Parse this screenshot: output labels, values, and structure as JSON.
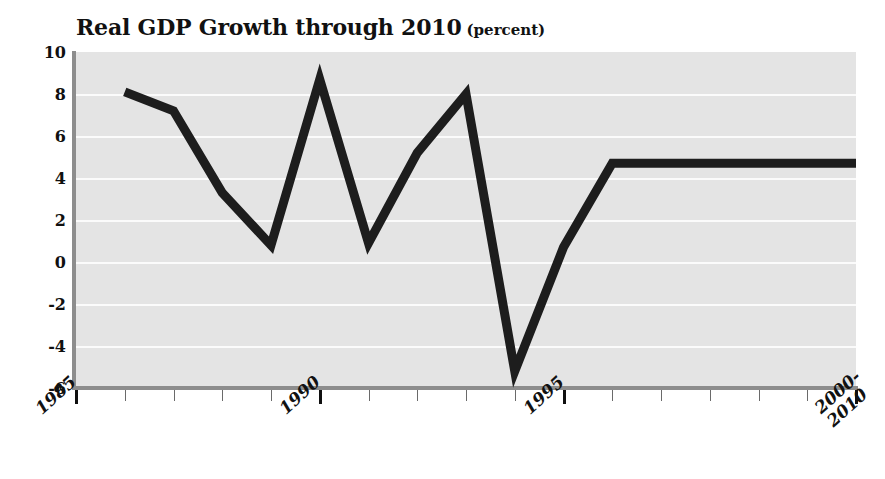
{
  "chart_data": {
    "type": "line",
    "title": "Real GDP Growth through 2010",
    "title_suffix": "(percent)",
    "xlabel": "",
    "ylabel": "",
    "grid": true,
    "legend": "none",
    "ylim": [
      -6,
      10
    ],
    "yticks": [
      10,
      8,
      6,
      4,
      2,
      0,
      -2,
      -4,
      -6
    ],
    "ytick_labels": [
      "10",
      "8",
      "6",
      "4",
      "2",
      "0",
      "-2",
      "-4",
      "-6"
    ],
    "xlim": [
      1985,
      2001
    ],
    "xtick_labels": [
      "1985",
      "1990",
      "1995",
      "2000-\n2010"
    ],
    "xtick_major_years": [
      1985,
      1990,
      1995,
      2001
    ],
    "xtick_minor_years": [
      1986,
      1987,
      1988,
      1989,
      1991,
      1992,
      1993,
      1994,
      1996,
      1997,
      1998,
      1999,
      2000
    ],
    "x": [
      1986,
      1987,
      1988,
      1989,
      1990,
      1991,
      1992,
      1993,
      1994,
      1995,
      1996,
      1997,
      1998,
      1999,
      2000,
      2001
    ],
    "values": [
      8.1,
      7.2,
      3.3,
      0.8,
      8.7,
      0.9,
      5.2,
      8.0,
      -5.2,
      0.7,
      4.7,
      4.7,
      4.7,
      4.7,
      4.7,
      4.7
    ],
    "series": [
      {
        "name": "Real GDP Growth",
        "color": "#1d1d1d",
        "line_width": 9,
        "values": [
          8.1,
          7.2,
          3.3,
          0.8,
          8.7,
          0.9,
          5.2,
          8.0,
          -5.2,
          0.7,
          4.7,
          4.7,
          4.7,
          4.7,
          4.7,
          4.7
        ]
      }
    ],
    "colors": {
      "plot_background": "#e4e4e4",
      "gridline": "#fbfbfb",
      "axis_rule": "#8d8d8d",
      "line": "#1d1d1d",
      "text": "#111111",
      "page_background": "#ffffff"
    }
  },
  "xlabels": [
    {
      "text": "1985",
      "line2": ""
    },
    {
      "text": "1990",
      "line2": ""
    },
    {
      "text": "1995",
      "line2": ""
    },
    {
      "text": "2000-",
      "line2": "2010"
    }
  ]
}
